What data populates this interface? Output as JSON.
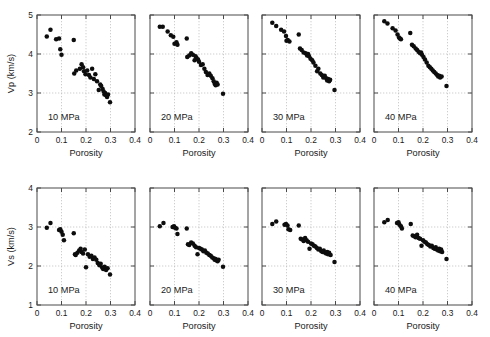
{
  "figure": {
    "background": "#ffffff",
    "marker_color": "#0d0d0d",
    "axis_color": "#4a4a4a",
    "grid_color": "#b9b9b9",
    "rows": 2,
    "cols": 4
  },
  "chart_data": [
    {
      "type": "scatter",
      "title": "",
      "annotation": "10 MPa",
      "xlabel": "Porosity",
      "ylabel": "Vp (km/s)",
      "xlim": [
        0,
        0.4
      ],
      "ylim": [
        2,
        5
      ],
      "xticks": [
        0,
        0.1,
        0.2,
        0.3,
        0.4
      ],
      "xticklabels": [
        "0",
        "0.1",
        "0.2",
        "0.3",
        "0.4"
      ],
      "yticks": [
        2,
        3,
        4,
        5
      ],
      "yticklabels": [
        "2",
        "3",
        "4",
        "5"
      ],
      "grid": true,
      "series": [
        {
          "name": "Vp at 10 MPa",
          "x": [
            0.04,
            0.055,
            0.078,
            0.09,
            0.095,
            0.1,
            0.15,
            0.152,
            0.16,
            0.175,
            0.182,
            0.188,
            0.192,
            0.198,
            0.205,
            0.212,
            0.218,
            0.225,
            0.232,
            0.238,
            0.245,
            0.252,
            0.258,
            0.262,
            0.268,
            0.272,
            0.275,
            0.278,
            0.282,
            0.286,
            0.29,
            0.298
          ],
          "y": [
            4.45,
            4.62,
            4.38,
            4.4,
            4.12,
            3.98,
            4.36,
            3.5,
            3.58,
            3.62,
            3.74,
            3.66,
            3.56,
            3.48,
            3.58,
            3.46,
            3.4,
            3.62,
            3.36,
            3.48,
            3.3,
            3.08,
            3.22,
            3.18,
            3.1,
            3.04,
            2.96,
            3.0,
            2.94,
            2.9,
            2.96,
            2.76
          ]
        }
      ]
    },
    {
      "type": "scatter",
      "title": "",
      "annotation": "20 MPa",
      "xlabel": "Porosity",
      "ylabel": "",
      "xlim": [
        0,
        0.4
      ],
      "ylim": [
        2,
        5
      ],
      "xticks": [
        0,
        0.1,
        0.2,
        0.3,
        0.4
      ],
      "xticklabels": [
        "0",
        "0.1",
        "0.2",
        "0.3",
        "0.4"
      ],
      "yticks": [
        2,
        3,
        4,
        5
      ],
      "yticklabels": [
        "",
        "",
        "",
        ""
      ],
      "grid": true,
      "series": [
        {
          "name": "Vp at 20 MPa",
          "x": [
            0.04,
            0.052,
            0.072,
            0.085,
            0.095,
            0.1,
            0.108,
            0.112,
            0.15,
            0.152,
            0.16,
            0.168,
            0.175,
            0.182,
            0.186,
            0.19,
            0.196,
            0.2,
            0.208,
            0.215,
            0.222,
            0.228,
            0.235,
            0.242,
            0.248,
            0.255,
            0.26,
            0.264,
            0.268,
            0.272,
            0.276,
            0.298
          ],
          "y": [
            4.7,
            4.7,
            4.58,
            4.48,
            4.44,
            4.26,
            4.3,
            4.24,
            4.4,
            3.92,
            3.96,
            4.02,
            3.98,
            3.84,
            3.94,
            3.9,
            3.86,
            3.8,
            3.72,
            3.74,
            3.62,
            3.54,
            3.46,
            3.5,
            3.44,
            3.38,
            3.3,
            3.24,
            3.2,
            3.26,
            3.22,
            2.98
          ]
        }
      ]
    },
    {
      "type": "scatter",
      "title": "",
      "annotation": "30 MPa",
      "xlabel": "Porosity",
      "ylabel": "",
      "xlim": [
        0,
        0.4
      ],
      "ylim": [
        2,
        5
      ],
      "xticks": [
        0,
        0.1,
        0.2,
        0.3,
        0.4
      ],
      "xticklabels": [
        "0",
        "0.1",
        "0.2",
        "0.3",
        "0.4"
      ],
      "yticks": [
        2,
        3,
        4,
        5
      ],
      "yticklabels": [
        "",
        "",
        "",
        ""
      ],
      "grid": true,
      "series": [
        {
          "name": "Vp at 30 MPa",
          "x": [
            0.042,
            0.058,
            0.078,
            0.09,
            0.098,
            0.1,
            0.105,
            0.112,
            0.15,
            0.155,
            0.162,
            0.17,
            0.178,
            0.184,
            0.188,
            0.192,
            0.198,
            0.205,
            0.21,
            0.218,
            0.225,
            0.23,
            0.238,
            0.244,
            0.25,
            0.256,
            0.262,
            0.266,
            0.27,
            0.274,
            0.278,
            0.296
          ],
          "y": [
            4.8,
            4.72,
            4.62,
            4.58,
            4.46,
            4.34,
            4.36,
            4.32,
            4.5,
            4.14,
            4.1,
            4.04,
            4.02,
            3.96,
            4.0,
            3.94,
            3.88,
            3.84,
            3.78,
            3.7,
            3.56,
            3.62,
            3.5,
            3.46,
            3.4,
            3.44,
            3.38,
            3.32,
            3.36,
            3.3,
            3.34,
            3.08
          ]
        }
      ]
    },
    {
      "type": "scatter",
      "title": "",
      "annotation": "40 MPa",
      "xlabel": "Porosity",
      "ylabel": "",
      "xlim": [
        0,
        0.4
      ],
      "ylim": [
        2,
        5
      ],
      "xticks": [
        0,
        0.1,
        0.2,
        0.3,
        0.4
      ],
      "xticklabels": [
        "0",
        "0.1",
        "0.2",
        "0.3",
        "0.4"
      ],
      "yticks": [
        2,
        3,
        4,
        5
      ],
      "yticklabels": [
        "",
        "",
        "",
        ""
      ],
      "grid": true,
      "series": [
        {
          "name": "Vp at 40 MPa",
          "x": [
            0.042,
            0.055,
            0.076,
            0.088,
            0.096,
            0.102,
            0.106,
            0.11,
            0.148,
            0.155,
            0.162,
            0.17,
            0.176,
            0.182,
            0.188,
            0.192,
            0.196,
            0.202,
            0.208,
            0.215,
            0.222,
            0.228,
            0.234,
            0.24,
            0.246,
            0.252,
            0.258,
            0.262,
            0.266,
            0.27,
            0.276,
            0.296
          ],
          "y": [
            4.84,
            4.78,
            4.66,
            4.6,
            4.5,
            4.42,
            4.4,
            4.38,
            4.54,
            4.24,
            4.2,
            4.14,
            4.1,
            4.06,
            4.02,
            4.04,
            3.98,
            3.92,
            3.86,
            3.78,
            3.7,
            3.66,
            3.62,
            3.58,
            3.54,
            3.5,
            3.46,
            3.42,
            3.44,
            3.4,
            3.42,
            3.18
          ]
        }
      ]
    },
    {
      "type": "scatter",
      "title": "",
      "annotation": "10 MPa",
      "xlabel": "Porosity",
      "ylabel": "Vs (km/s)",
      "xlim": [
        0,
        0.4
      ],
      "ylim": [
        1,
        4
      ],
      "xticks": [
        0,
        0.1,
        0.2,
        0.3,
        0.4
      ],
      "xticklabels": [
        "0",
        "0.1",
        "0.2",
        "0.3",
        "0.4"
      ],
      "yticks": [
        1,
        2,
        3,
        4
      ],
      "yticklabels": [
        "1",
        "2",
        "3",
        "4"
      ],
      "grid": true,
      "series": [
        {
          "name": "Vs at 10 MPa",
          "x": [
            0.04,
            0.055,
            0.09,
            0.095,
            0.1,
            0.105,
            0.11,
            0.15,
            0.155,
            0.158,
            0.165,
            0.172,
            0.178,
            0.182,
            0.188,
            0.195,
            0.2,
            0.208,
            0.215,
            0.222,
            0.228,
            0.235,
            0.242,
            0.248,
            0.255,
            0.26,
            0.266,
            0.27,
            0.276,
            0.282,
            0.288,
            0.298
          ],
          "y": [
            2.98,
            3.1,
            2.92,
            2.94,
            2.88,
            2.8,
            2.66,
            2.84,
            2.3,
            2.28,
            2.34,
            2.4,
            2.44,
            2.36,
            2.32,
            2.42,
            1.97,
            2.3,
            2.24,
            2.26,
            2.18,
            2.22,
            2.16,
            2.08,
            2.02,
            2.06,
            1.96,
            1.92,
            1.98,
            1.9,
            1.94,
            1.78
          ]
        }
      ]
    },
    {
      "type": "scatter",
      "title": "",
      "annotation": "20 MPa",
      "xlabel": "Porosity",
      "ylabel": "",
      "xlim": [
        0,
        0.4
      ],
      "ylim": [
        1,
        4
      ],
      "xticks": [
        0,
        0.1,
        0.2,
        0.3,
        0.4
      ],
      "xticklabels": [
        "0",
        "0.1",
        "0.2",
        "0.3",
        "0.4"
      ],
      "yticks": [
        1,
        2,
        3,
        4
      ],
      "yticklabels": [
        "",
        "",
        "",
        ""
      ],
      "grid": true,
      "series": [
        {
          "name": "Vs at 20 MPa",
          "x": [
            0.04,
            0.055,
            0.092,
            0.098,
            0.102,
            0.108,
            0.112,
            0.15,
            0.155,
            0.16,
            0.168,
            0.175,
            0.182,
            0.188,
            0.194,
            0.2,
            0.206,
            0.212,
            0.218,
            0.224,
            0.23,
            0.236,
            0.242,
            0.248,
            0.254,
            0.26,
            0.264,
            0.268,
            0.272,
            0.276,
            0.28,
            0.298
          ],
          "y": [
            3.02,
            3.1,
            3.0,
            3.02,
            2.98,
            2.96,
            2.82,
            2.96,
            2.56,
            2.54,
            2.6,
            2.58,
            2.52,
            2.48,
            2.3,
            2.46,
            2.44,
            2.42,
            2.38,
            2.4,
            2.34,
            2.32,
            2.28,
            2.26,
            2.22,
            2.2,
            2.16,
            2.18,
            2.14,
            2.12,
            2.16,
            1.98
          ]
        }
      ]
    },
    {
      "type": "scatter",
      "title": "",
      "annotation": "30 MPa",
      "xlabel": "Porosity",
      "ylabel": "",
      "xlim": [
        0,
        0.4
      ],
      "ylim": [
        1,
        4
      ],
      "xticks": [
        0,
        0.1,
        0.2,
        0.3,
        0.4
      ],
      "xticklabels": [
        "0",
        "0.1",
        "0.2",
        "0.3",
        "0.4"
      ],
      "yticks": [
        1,
        2,
        3,
        4
      ],
      "yticklabels": [
        "",
        "",
        "",
        ""
      ],
      "grid": true,
      "series": [
        {
          "name": "Vs at 30 MPa",
          "x": [
            0.042,
            0.058,
            0.092,
            0.098,
            0.104,
            0.108,
            0.115,
            0.15,
            0.158,
            0.164,
            0.17,
            0.176,
            0.182,
            0.188,
            0.194,
            0.2,
            0.206,
            0.212,
            0.218,
            0.224,
            0.23,
            0.236,
            0.242,
            0.248,
            0.252,
            0.258,
            0.262,
            0.266,
            0.27,
            0.274,
            0.28,
            0.296
          ],
          "y": [
            3.08,
            3.14,
            3.06,
            3.08,
            3.04,
            2.94,
            2.92,
            3.04,
            2.7,
            2.68,
            2.64,
            2.72,
            2.66,
            2.62,
            2.44,
            2.58,
            2.56,
            2.52,
            2.5,
            2.46,
            2.42,
            2.44,
            2.38,
            2.36,
            2.4,
            2.34,
            2.32,
            2.36,
            2.3,
            2.34,
            2.28,
            2.1
          ]
        }
      ]
    },
    {
      "type": "scatter",
      "title": "",
      "annotation": "40 MPa",
      "xlabel": "Porosity",
      "ylabel": "",
      "xlim": [
        0,
        0.4
      ],
      "ylim": [
        1,
        4
      ],
      "xticks": [
        0,
        0.1,
        0.2,
        0.3,
        0.4
      ],
      "xticklabels": [
        "0",
        "0.1",
        "0.2",
        "0.3",
        "0.4"
      ],
      "yticks": [
        1,
        2,
        3,
        4
      ],
      "yticklabels": [
        "",
        "",
        "",
        ""
      ],
      "grid": true,
      "series": [
        {
          "name": "Vs at 40 MPa",
          "x": [
            0.042,
            0.056,
            0.094,
            0.1,
            0.104,
            0.11,
            0.114,
            0.15,
            0.158,
            0.164,
            0.17,
            0.176,
            0.182,
            0.188,
            0.194,
            0.2,
            0.206,
            0.212,
            0.218,
            0.224,
            0.23,
            0.236,
            0.242,
            0.248,
            0.252,
            0.256,
            0.262,
            0.266,
            0.27,
            0.274,
            0.278,
            0.296
          ],
          "y": [
            3.12,
            3.18,
            3.1,
            3.12,
            3.06,
            3.02,
            2.96,
            3.08,
            2.78,
            2.76,
            2.74,
            2.8,
            2.72,
            2.7,
            2.52,
            2.66,
            2.62,
            2.6,
            2.56,
            2.54,
            2.5,
            2.52,
            2.46,
            2.44,
            2.48,
            2.42,
            2.4,
            2.44,
            2.38,
            2.42,
            2.36,
            2.18
          ]
        }
      ]
    }
  ]
}
